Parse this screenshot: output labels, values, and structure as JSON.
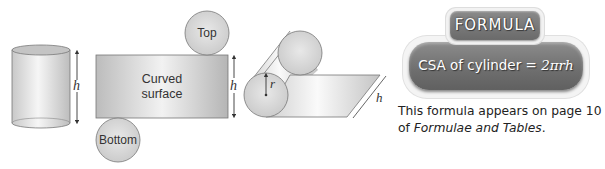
{
  "figure": {
    "cylinder": {
      "height_label": "h"
    },
    "net": {
      "rectangle_label_line1": "Curved",
      "rectangle_label_line2": "surface",
      "top_circle_label": "Top",
      "bottom_circle_label": "Bottom",
      "height_label": "h"
    },
    "rolled": {
      "radius_label": "r",
      "height_label": "h"
    }
  },
  "formula_box": {
    "title": "FORMULA",
    "formula_text": "CSA of cylinder = ",
    "formula_expression": "2πrh",
    "colors": {
      "badge_fill": "#7a7a7a",
      "badge_border": "#f2f2f2",
      "text": "#ffffff"
    }
  },
  "note": {
    "line1": "This formula appears on page 10",
    "line2_prefix": "of ",
    "line2_italic": "Formulae and Tables",
    "line2_suffix": "."
  }
}
